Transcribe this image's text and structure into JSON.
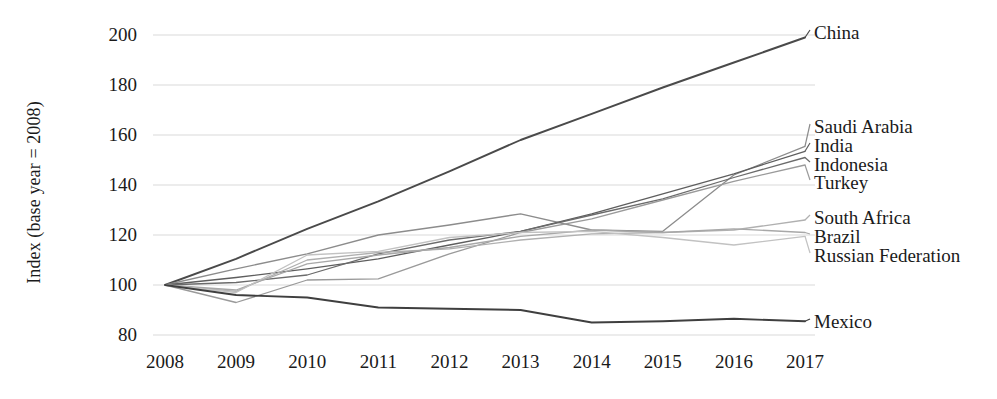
{
  "chart_data": {
    "type": "line",
    "title": "",
    "xlabel": "",
    "ylabel": "Index (base year = 2008)",
    "categories": [
      2008,
      2009,
      2010,
      2011,
      2012,
      2013,
      2014,
      2015,
      2016,
      2017
    ],
    "x_tick_labels": [
      "2008",
      "2009",
      "2010",
      "2011",
      "2012",
      "2013",
      "2014",
      "2015",
      "2016",
      "2017"
    ],
    "y_tick_labels": [
      "200",
      "180",
      "160",
      "140",
      "120",
      "100",
      "80"
    ],
    "y_ticks": [
      200,
      180,
      160,
      140,
      120,
      100,
      80
    ],
    "ylim": [
      80,
      200
    ],
    "xlim": [
      2008,
      2017
    ],
    "grid": true,
    "grid_axis": "y",
    "legend_position": "right-inline-labels",
    "series": [
      {
        "name": "China",
        "color": "#4a4a4a",
        "label_y": 36,
        "values": [
          100,
          110.5,
          122.5,
          133.5,
          145.5,
          158.0,
          168.5,
          179.0,
          189.0,
          199.0
        ]
      },
      {
        "name": "Saudi Arabia",
        "color": "#8c8c8c",
        "label_y": 130,
        "values": [
          100,
          106.5,
          112.5,
          120.0,
          124.0,
          128.5,
          122.0,
          121.5,
          144.0,
          155.5
        ]
      },
      {
        "name": "India",
        "color": "#5e5e5e",
        "label_y": 149,
        "values": [
          100,
          103.0,
          106.5,
          110.5,
          116.0,
          121.5,
          128.5,
          136.5,
          144.5,
          153.5
        ]
      },
      {
        "name": "Indonesia",
        "color": "#6b6b6b",
        "label_y": 168,
        "values": [
          100,
          101.0,
          104.0,
          112.5,
          118.0,
          121.5,
          128.0,
          134.5,
          143.0,
          151.0
        ]
      },
      {
        "name": "Turkey",
        "color": "#9a9a9a",
        "label_y": 186,
        "values": [
          100,
          93.0,
          102.0,
          102.5,
          112.5,
          121.0,
          126.5,
          134.0,
          141.5,
          148.0
        ]
      },
      {
        "name": "South Africa",
        "color": "#b0b0b0",
        "label_y": 221,
        "values": [
          100,
          97.5,
          110.0,
          113.0,
          114.5,
          118.0,
          120.5,
          121.0,
          122.0,
          126.0
        ]
      },
      {
        "name": "Brazil",
        "color": "#a8a8a8",
        "label_y": 240,
        "values": [
          100,
          98.0,
          108.5,
          112.0,
          115.0,
          119.5,
          122.0,
          121.0,
          122.5,
          121.0
        ]
      },
      {
        "name": "Russian Federation",
        "color": "#c2c2c2",
        "label_y": 259,
        "values": [
          100,
          97.0,
          112.0,
          113.5,
          119.0,
          121.0,
          121.5,
          119.0,
          116.0,
          119.5
        ]
      },
      {
        "name": "Mexico",
        "color": "#3f3f3f",
        "label_y": 325,
        "values": [
          100,
          96.0,
          95.0,
          91.0,
          90.5,
          90.0,
          85.0,
          85.5,
          86.5,
          85.5
        ]
      }
    ]
  },
  "axes": {
    "grid_color": "#d9d9d9",
    "text_color": "#1a1a1a"
  },
  "plot_geometry": {
    "left": 165,
    "right": 805,
    "top": 35,
    "bottom": 335
  }
}
